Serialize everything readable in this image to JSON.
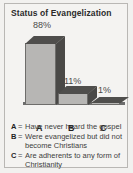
{
  "card": {
    "title": "Status of Evangelization"
  },
  "axis_labels": {
    "a": "A",
    "b": "B",
    "c": "C"
  },
  "legend": {
    "separator": "=",
    "items": [
      {
        "key": "A",
        "text": "Have never heard the gospel"
      },
      {
        "key": "B",
        "text": "Were evangelized but did not become Christians"
      },
      {
        "key": "C",
        "text": "Are adherents to any form of Christianity"
      }
    ]
  },
  "colors": {
    "background": "#f2f1ef",
    "card_background": "#f4f3f1",
    "border": "#b9b7b4",
    "bar_front": "#b7b6b4",
    "bar_top": "#4f4e4c",
    "bar_side": "#4a4947",
    "baseline": "#6d6d6d",
    "title_text": "#2b2b2b",
    "legend_text": "#3d3d3d"
  },
  "chart_data": {
    "type": "bar",
    "title": "Status of Evangelization",
    "xlabel": "",
    "ylabel": "",
    "ylim": [
      0,
      100
    ],
    "grid": false,
    "legend_position": "below",
    "categories": [
      "A",
      "B",
      "C"
    ],
    "values": [
      88,
      11,
      1
    ],
    "data_labels": [
      "88%",
      "11%",
      "1%"
    ],
    "category_descriptions": [
      "Have never heard the gospel",
      "Were evangelized but did not become Christians",
      "Are adherents to any form of Christianity"
    ],
    "style": "3d-bar",
    "units": "percent"
  }
}
